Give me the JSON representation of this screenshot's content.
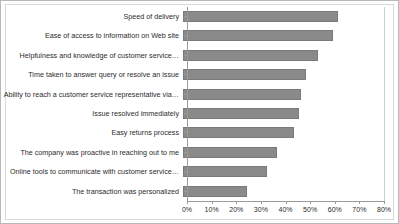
{
  "chart_data": {
    "type": "bar",
    "orientation": "horizontal",
    "title": "",
    "xlabel": "",
    "ylabel": "",
    "xlim": [
      0,
      80
    ],
    "grid": false,
    "legend": null,
    "bar_color": "#8a8a8a",
    "tick_labels": [
      "0%",
      "10%",
      "20%",
      "30%",
      "40%",
      "50%",
      "60%",
      "70%",
      "80%"
    ],
    "tick_values": [
      0,
      10,
      20,
      30,
      40,
      50,
      60,
      70,
      80
    ],
    "categories": [
      "Speed of delivery",
      "Ease of access to information on Web site",
      "Helpfulness and knowledge of customer service…",
      "Time taken to answer query or resolve an issue",
      "Ability to reach a customer service representative via…",
      "Issue resolved immediately",
      "Easy returns process",
      "The company was proactive in reaching out to me",
      "Online tools to communicate with customer service…",
      "The transaction was personalized"
    ],
    "values": [
      63,
      61,
      55,
      50,
      48,
      47,
      45,
      38,
      34,
      26
    ]
  }
}
